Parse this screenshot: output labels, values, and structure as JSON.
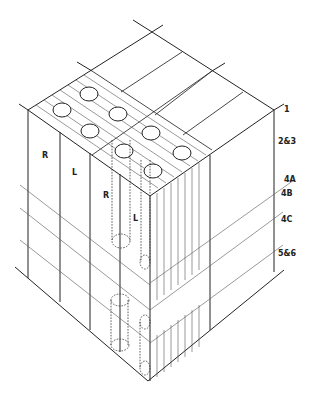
{
  "diagram": {
    "type": "isometric-cutaway-block",
    "layer_labels": [
      {
        "id": "layer-1",
        "text": "1"
      },
      {
        "id": "layer-2-3",
        "text": "2&3"
      },
      {
        "id": "layer-4a",
        "text": "4A"
      },
      {
        "id": "layer-4b",
        "text": "4B"
      },
      {
        "id": "layer-4c",
        "text": "4C"
      },
      {
        "id": "layer-5-6",
        "text": "5&6"
      }
    ],
    "face_labels": [
      {
        "id": "outer-r",
        "text": "R"
      },
      {
        "id": "outer-l",
        "text": "L"
      },
      {
        "id": "inner-r",
        "text": "R"
      },
      {
        "id": "inner-l",
        "text": "L"
      }
    ],
    "colors": {
      "line": "#222222",
      "background": "#ffffff"
    }
  }
}
